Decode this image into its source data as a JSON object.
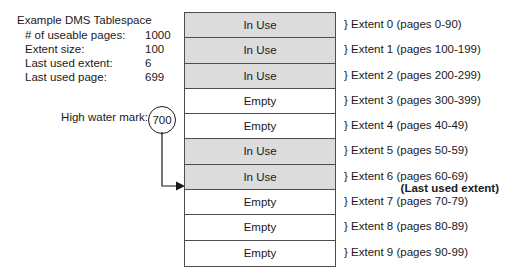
{
  "info": {
    "title": "Example DMS Tablespace",
    "stats": [
      {
        "label": "# of useable pages:",
        "value": "1000"
      },
      {
        "label": "Extent size:",
        "value": "100"
      },
      {
        "label": "Last used extent:",
        "value": "6"
      },
      {
        "label": "Last used page:",
        "value": "699"
      }
    ]
  },
  "high_water_mark": {
    "label": "High water mark:",
    "value": "700"
  },
  "extents": [
    {
      "state": "In Use",
      "in_use": true,
      "label": "} Extent 0 (pages 0-90)",
      "sub": ""
    },
    {
      "state": "In Use",
      "in_use": true,
      "label": "} Extent 1 (pages 100-199)",
      "sub": ""
    },
    {
      "state": "In Use",
      "in_use": true,
      "label": "} Extent 2 (pages 200-299)",
      "sub": ""
    },
    {
      "state": "Empty",
      "in_use": false,
      "label": "} Extent 3 (pages 300-399)",
      "sub": ""
    },
    {
      "state": "Empty",
      "in_use": false,
      "label": "} Extent 4 (pages 40-49)",
      "sub": ""
    },
    {
      "state": "In Use",
      "in_use": true,
      "label": "} Extent 5 (pages 50-59)",
      "sub": ""
    },
    {
      "state": "In Use",
      "in_use": true,
      "label": "} Extent 6 (pages 60-69)",
      "sub": "(Last used extent)"
    },
    {
      "state": "Empty",
      "in_use": false,
      "label": "} Extent 7 (pages 70-79)",
      "sub": ""
    },
    {
      "state": "Empty",
      "in_use": false,
      "label": "} Extent 8 (pages 80-89)",
      "sub": ""
    },
    {
      "state": "Empty",
      "in_use": false,
      "label": "} Extent 9 (pages 90-99)",
      "sub": ""
    }
  ],
  "colors": {
    "in_use_fill": "#dcdcdc",
    "empty_fill": "#ffffff",
    "border": "#4d4d4d",
    "text": "#1a1a1a"
  }
}
